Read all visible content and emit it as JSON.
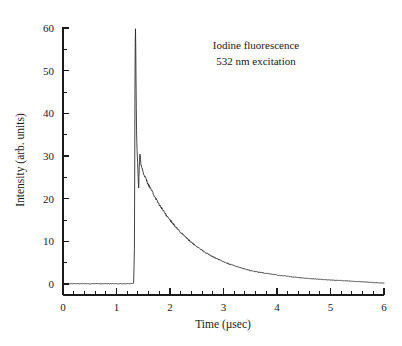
{
  "figure": {
    "background_color": "#ffffff",
    "line_color": "#222222",
    "text_color": "#1a1a1a"
  },
  "annotation": {
    "line1": "Iodine fluorescence",
    "line2": "532 nm excitation"
  },
  "axes": {
    "x_title": "Time (µsec)",
    "y_title": "Intensity (arb. units)",
    "x_ticks": [
      "0",
      "1",
      "2",
      "3",
      "4",
      "5",
      "6"
    ],
    "y_ticks": [
      "0",
      "10",
      "20",
      "30",
      "40",
      "50",
      "60"
    ]
  },
  "chart_data": {
    "type": "line",
    "title": "",
    "subtitle": "",
    "xlabel": "Time (µsec)",
    "ylabel": "Intensity (arb. units)",
    "xlim": [
      0,
      6
    ],
    "ylim": [
      -2,
      61
    ],
    "xtick_values": [
      0,
      1,
      2,
      3,
      4,
      5,
      6
    ],
    "ytick_values": [
      0,
      10,
      20,
      30,
      40,
      50,
      60
    ],
    "x_minor_tick_interval": 0.2,
    "y_minor_tick_interval": 5,
    "grid": false,
    "legend": null,
    "annotations": [
      {
        "text": "Iodine fluorescence",
        "x": 3.6,
        "y": 54
      },
      {
        "text": "532 nm excitation",
        "x": 3.6,
        "y": 49
      }
    ],
    "series": [
      {
        "name": "Iodine fluorescence decay",
        "x": [
          0.0,
          0.1,
          0.2,
          0.3,
          0.4,
          0.5,
          0.6,
          0.7,
          0.8,
          0.9,
          1.0,
          1.1,
          1.2,
          1.28,
          1.32,
          1.335,
          1.34,
          1.345,
          1.35,
          1.355,
          1.36,
          1.365,
          1.37,
          1.375,
          1.38,
          1.385,
          1.39,
          1.395,
          1.4,
          1.405,
          1.41,
          1.415,
          1.42,
          1.43,
          1.44,
          1.45,
          1.46,
          1.48,
          1.5,
          1.55,
          1.6,
          1.65,
          1.7,
          1.75,
          1.8,
          1.85,
          1.9,
          1.95,
          2.0,
          2.1,
          2.2,
          2.3,
          2.4,
          2.5,
          2.6,
          2.7,
          2.8,
          2.9,
          3.0,
          3.1,
          3.2,
          3.3,
          3.4,
          3.5,
          3.6,
          3.7,
          3.8,
          3.9,
          4.0,
          4.2,
          4.4,
          4.6,
          4.8,
          5.0,
          5.2,
          5.4,
          5.6,
          5.8,
          6.0
        ],
        "y": [
          0.1,
          0.05,
          0.1,
          0.05,
          0.1,
          0.05,
          0.1,
          0.05,
          0.1,
          0.05,
          0.1,
          0.05,
          0.1,
          0.1,
          0.2,
          8.0,
          25.0,
          45.0,
          57.0,
          59.5,
          56.0,
          48.0,
          41.0,
          36.0,
          33.0,
          31.0,
          29.5,
          28.0,
          26.5,
          25.0,
          23.5,
          22.5,
          25.5,
          29.0,
          30.5,
          29.0,
          28.0,
          27.0,
          26.2,
          24.6,
          23.2,
          22.0,
          20.8,
          19.7,
          18.6,
          17.6,
          16.7,
          15.8,
          15.0,
          13.5,
          12.1,
          10.9,
          9.8,
          8.8,
          7.9,
          7.1,
          6.4,
          5.8,
          5.2,
          4.7,
          4.3,
          3.9,
          3.5,
          3.2,
          2.9,
          2.7,
          2.5,
          2.3,
          2.1,
          1.8,
          1.5,
          1.3,
          1.1,
          0.95,
          0.8,
          0.65,
          0.5,
          0.35,
          0.2
        ]
      }
    ]
  }
}
